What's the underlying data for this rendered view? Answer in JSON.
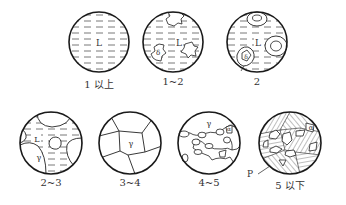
{
  "diagram": {
    "type": "solidification-microstructure-stages",
    "panels": [
      {
        "id": "p1",
        "label": "1 以上",
        "phases": [
          "L"
        ],
        "cx": 99,
        "cy": 42,
        "r": 30
      },
      {
        "id": "p2",
        "label": "1~2",
        "phases": [
          "L",
          "δ"
        ],
        "cx": 173,
        "cy": 42,
        "r": 30
      },
      {
        "id": "p3",
        "label": "2",
        "phases": [
          "L",
          "δ"
        ],
        "cx": 257,
        "cy": 42,
        "r": 30
      },
      {
        "id": "p4",
        "label": "2~3",
        "phases": [
          "L",
          "γ"
        ],
        "cx": 51,
        "cy": 143,
        "r": 31
      },
      {
        "id": "p5",
        "label": "3~4",
        "phases": [
          "γ"
        ],
        "cx": 130,
        "cy": 143,
        "r": 31
      },
      {
        "id": "p6",
        "label": "4~5",
        "phases": [
          "γ",
          "α"
        ],
        "cx": 209,
        "cy": 143,
        "r": 31
      },
      {
        "id": "p7",
        "label": "5 以下",
        "phases": [
          "α",
          "P"
        ],
        "cx": 290,
        "cy": 143,
        "r": 31
      }
    ],
    "phase_labels": {
      "liquid": "L",
      "delta": "δ",
      "gamma": "γ",
      "alpha": "α",
      "pearlite": "P"
    },
    "colors": {
      "stroke": "#1a1a1a",
      "text": "#333333",
      "background": "#ffffff"
    }
  }
}
